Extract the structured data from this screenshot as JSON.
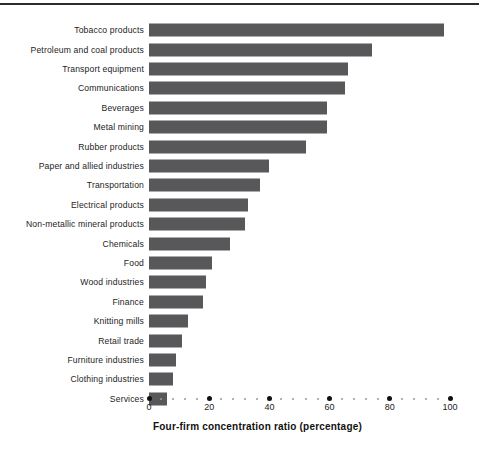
{
  "chart_data": {
    "type": "bar",
    "orientation": "horizontal",
    "title": "",
    "subtitle": "",
    "xlabel": "Four-firm concentration ratio (percentage)",
    "ylabel": "",
    "xlim": [
      0,
      100
    ],
    "xticks": [
      0,
      20,
      40,
      60,
      80,
      100
    ],
    "xtick_labels": [
      "0",
      "20",
      "40",
      "60",
      "80",
      "100"
    ],
    "minor_tick_step": 4,
    "grid": false,
    "legend": null,
    "bar_color": "#58585a",
    "categories": [
      "Tobacco products",
      "Petroleum and coal products",
      "Transport equipment",
      "Communications",
      "Beverages",
      "Metal mining",
      "Rubber products",
      "Paper and allied industries",
      "Transportation",
      "Electrical products",
      "Non-metallic mineral products",
      "Chemicals",
      "Food",
      "Wood industries",
      "Finance",
      "Knitting mills",
      "Retail trade",
      "Furniture industries",
      "Clothing industries",
      "Services"
    ],
    "values": [
      98,
      74,
      66,
      65,
      59,
      59,
      52,
      40,
      37,
      33,
      32,
      27,
      21,
      19,
      18,
      13,
      11,
      9,
      8,
      6
    ]
  }
}
